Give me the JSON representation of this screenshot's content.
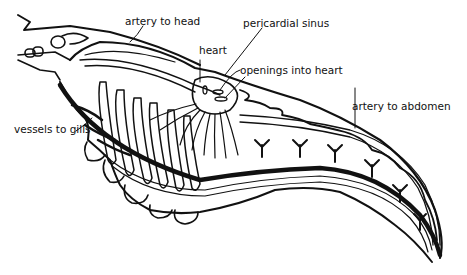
{
  "diagram": {
    "labels": {
      "artery_to_head": "artery to head",
      "heart": "heart",
      "pericardial_sinus": "pericardial sinus",
      "openings_into_heart": "openings into heart",
      "artery_to_abdomen": "artery to abdomen",
      "vessels_to_gills": "vessels to gills"
    },
    "colors": {
      "line": "#111111",
      "background": "#ffffff"
    }
  }
}
